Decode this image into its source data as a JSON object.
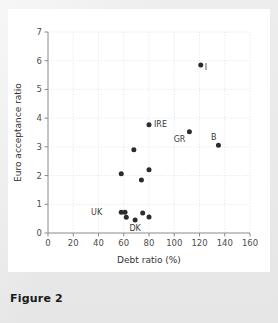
{
  "figure": {
    "caption": "Figure 2",
    "card_bg": "#ffffff",
    "page_bg": "#e8e8e8"
  },
  "chart_data": {
    "type": "scatter",
    "title": "",
    "xlabel": "Debt ratio (%)",
    "ylabel": "Euro acceptance ratio",
    "xlim": [
      0,
      160
    ],
    "ylim": [
      0,
      7
    ],
    "xticks": [
      0,
      20,
      40,
      60,
      80,
      100,
      120,
      140,
      160
    ],
    "yticks": [
      0,
      1,
      2,
      3,
      4,
      5,
      6,
      7
    ],
    "grid": true,
    "legend": "none",
    "marker_color": "#2b2b2b",
    "points": [
      {
        "label": "I",
        "x": 121,
        "y": 5.85,
        "label_dx": 4,
        "label_dy": 5
      },
      {
        "label": "IRE",
        "x": 80,
        "y": 3.77,
        "label_dx": 5,
        "label_dy": 2.5
      },
      {
        "label": "GR",
        "x": 112,
        "y": 3.53,
        "label_dx": -4,
        "label_dy": 10
      },
      {
        "label": "B",
        "x": 135,
        "y": 3.06,
        "label_dx": -2,
        "label_dy": -5
      },
      {
        "label": "",
        "x": 68,
        "y": 2.9,
        "label_dx": 0,
        "label_dy": 0
      },
      {
        "label": "",
        "x": 80,
        "y": 2.2,
        "label_dx": 0,
        "label_dy": 0
      },
      {
        "label": "",
        "x": 58,
        "y": 2.06,
        "label_dx": 0,
        "label_dy": 0
      },
      {
        "label": "",
        "x": 74,
        "y": 1.85,
        "label_dx": 0,
        "label_dy": 0
      },
      {
        "label": "UK",
        "x": 58,
        "y": 0.72,
        "label_dx": -19,
        "label_dy": 3
      },
      {
        "label": "",
        "x": 61,
        "y": 0.72,
        "label_dx": 0,
        "label_dy": 0
      },
      {
        "label": "",
        "x": 62,
        "y": 0.55,
        "label_dx": 0,
        "label_dy": 0
      },
      {
        "label": "DK",
        "x": 69,
        "y": 0.45,
        "label_dx": 0,
        "label_dy": 11
      },
      {
        "label": "",
        "x": 75,
        "y": 0.7,
        "label_dx": 0,
        "label_dy": 0
      },
      {
        "label": "",
        "x": 80,
        "y": 0.56,
        "label_dx": 0,
        "label_dy": 0
      }
    ]
  }
}
